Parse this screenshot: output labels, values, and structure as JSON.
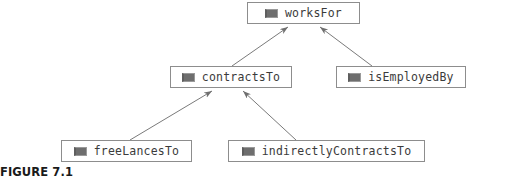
{
  "figure": {
    "caption": "FIGURE 7.1"
  },
  "diagram": {
    "type": "property-hierarchy",
    "icon_name": "property-icon",
    "node_border_color": "#8d8d8d",
    "node_fill_color": "#ffffff",
    "edge_color": "#7a7a7a",
    "label_color": "#3b3b3b",
    "nodes": [
      {
        "id": "worksFor",
        "label": "worksFor",
        "x": 247,
        "y": 2,
        "w": 113,
        "h": 22
      },
      {
        "id": "contractsTo",
        "label": "contractsTo",
        "x": 170,
        "y": 66,
        "w": 122,
        "h": 22
      },
      {
        "id": "isEmployedBy",
        "label": "isEmployedBy",
        "x": 336,
        "y": 66,
        "w": 130,
        "h": 22
      },
      {
        "id": "freeLancesTo",
        "label": "freeLancesTo",
        "x": 61,
        "y": 140,
        "w": 131,
        "h": 22
      },
      {
        "id": "indirectlyContractsTo",
        "label": "indirectlyContractsTo",
        "x": 228,
        "y": 140,
        "w": 197,
        "h": 22
      }
    ],
    "edges": [
      {
        "from": "contractsTo",
        "to": "worksFor",
        "x1": 232,
        "y1": 66,
        "x2": 288,
        "y2": 26
      },
      {
        "from": "isEmployedBy",
        "to": "worksFor",
        "x1": 372,
        "y1": 66,
        "x2": 320,
        "y2": 26
      },
      {
        "from": "freeLancesTo",
        "to": "contractsTo",
        "x1": 130,
        "y1": 140,
        "x2": 212,
        "y2": 90
      },
      {
        "from": "indirectlyContractsTo",
        "to": "contractsTo",
        "x1": 296,
        "y1": 140,
        "x2": 243,
        "y2": 90
      }
    ]
  }
}
